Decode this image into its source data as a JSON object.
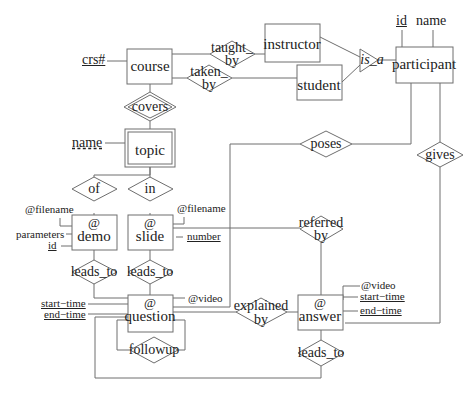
{
  "diagram": {
    "title": "",
    "entities": {
      "course": "course",
      "instructor": "instructor",
      "student": "student",
      "participant": "participant",
      "topic": "topic",
      "demo_prefix": "@",
      "demo": "demo",
      "slide_prefix": "@",
      "slide": "slide",
      "question_prefix": "@",
      "question": "question",
      "answer_prefix": "@",
      "answer": "answer"
    },
    "relationships": {
      "taught_by_1": "taught_",
      "taught_by_2": "by",
      "taken_by_1": "taken_",
      "taken_by_2": "by",
      "is_a": "is_a",
      "covers": "covers",
      "poses": "poses",
      "gives": "gives",
      "of": "of",
      "in": "in",
      "referred_by_1": "referred",
      "referred_by_2": "by",
      "demo_leads_to": "leads_to",
      "slide_leads_to": "leads_to",
      "explained_by_1": "explained",
      "explained_by_2": "by",
      "followup": "followup",
      "answer_leads_to": "leads_to"
    },
    "attributes": {
      "course_crs": "crs#",
      "participant_id": "id",
      "participant_name": "name",
      "topic_name": "name",
      "demo_filename": "@filename",
      "demo_parameters": "parameters",
      "demo_id": "id",
      "slide_filename": "@filename",
      "slide_number": "number",
      "question_video": "@video",
      "question_start": "start−time",
      "question_end": "end−time",
      "answer_video": "@video",
      "answer_start": "start−time",
      "answer_end": "end−time"
    }
  }
}
